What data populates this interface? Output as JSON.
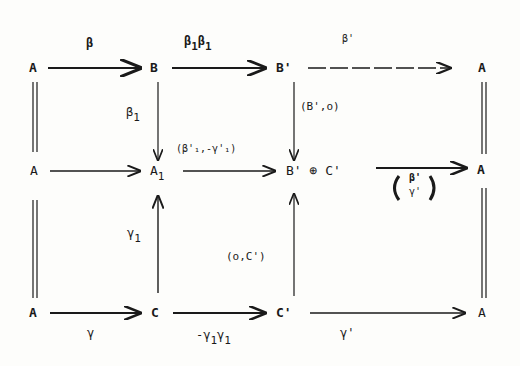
{
  "nodes": {
    "r1c1": "A",
    "r1c2": "B",
    "r1c3": "B'",
    "r1c4": "A",
    "r2c1": "A",
    "r2c2": "A",
    "r2c2_sub": "1",
    "r2c3": "B' ⊕ C'",
    "r2c4": "A",
    "r3c1": "A",
    "r3c2": "C",
    "r3c3": "C'",
    "r3c4": "A"
  },
  "labels": {
    "beta": "β",
    "beta1beta1p_a": "β",
    "beta1beta1p_b": "1",
    "beta1beta1p_c": "β",
    "beta1beta1p_d": "1",
    "beta_prime": "β'",
    "beta1": "β",
    "beta1_sub": "1",
    "b_prime_zero": "(B',o)",
    "pair_label": "(β'₁,-γ'₁)",
    "column_top": "β'",
    "column_bottom": "γ'",
    "gamma1": "γ",
    "gamma1_sub": "1",
    "zero_c_prime": "(o,C')",
    "gamma": "γ",
    "neg_gamma": "-γ",
    "neg_gamma_sub": "1",
    "neg_gamma2": "γ",
    "neg_gamma2_sub": "1",
    "gamma_prime": "γ'"
  }
}
